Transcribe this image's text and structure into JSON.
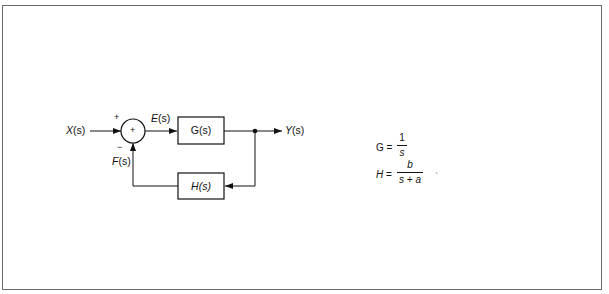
{
  "diagram": {
    "type": "feedback-control-block-diagram",
    "input_label": {
      "var": "X",
      "arg": "(s)"
    },
    "error_label": {
      "var": "E",
      "arg": "(s)"
    },
    "feedback_label": {
      "var": "F",
      "arg": "(s)"
    },
    "output_label": {
      "var": "Y",
      "arg": "(s)"
    },
    "summing_junction": {
      "symbol": "+",
      "plus_sign": "+",
      "minus_sign": "−"
    },
    "forward_block": {
      "label": "G(s)"
    },
    "feedback_block": {
      "var": "H",
      "arg": "(s)"
    }
  },
  "equations": {
    "g": {
      "lhs": "G =",
      "numerator": "1",
      "denominator": "s"
    },
    "h": {
      "lhs_var": "H",
      "lhs_eq": " =",
      "numerator": "b",
      "denominator": "s + a"
    },
    "stray_mark": "`"
  },
  "colors": {
    "line": "#111111",
    "border": "#6a6a6a",
    "background": "#ffffff"
  }
}
